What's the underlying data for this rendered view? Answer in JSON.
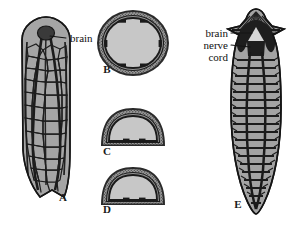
{
  "figure": {
    "background_color": "#ffffff",
    "ink_color": "#1a1a1a",
    "tissue_fill": "#a8a8a8",
    "lumen_fill": "#c9c9c9",
    "dark_fill": "#2b2b2b"
  },
  "panels": [
    {
      "letter": "A",
      "name": "nerve-net-whole-mount",
      "description": "Elongate flatworm body in dorsal view showing irregular meshlike nerve net",
      "letter_x": 63,
      "letter_y": 201
    },
    {
      "letter": "B",
      "name": "oval-cross-section",
      "description": "Rounded oval cross section with stippled cortical layer",
      "letter_x": 107,
      "letter_y": 73
    },
    {
      "letter": "C",
      "name": "dome-cross-section-upper",
      "description": "Dome shaped cross section, flattened ventral surface",
      "letter_x": 107,
      "letter_y": 155
    },
    {
      "letter": "D",
      "name": "dome-cross-section-lower",
      "description": "Dome shaped cross section, flattened ventral surface",
      "letter_x": 107,
      "letter_y": 213
    },
    {
      "letter": "E",
      "name": "ladder-nervous-system-whole-mount",
      "description": "Planarian with auricled head, bilobed brain and ladderlike paired ventral nerve cords",
      "letter_x": 238,
      "letter_y": 208
    }
  ],
  "callouts": [
    {
      "id": "brain-a",
      "label": "brain",
      "text_x": 70,
      "text_y": 42,
      "anchor": "start",
      "leader_from_x": 66,
      "leader_from_y": 38,
      "leader_to_x": 45,
      "leader_to_y": 38,
      "target_panel": "A"
    },
    {
      "id": "brain-e",
      "label": "brain",
      "text_x": 228,
      "text_y": 36,
      "anchor": "end",
      "leader_from_x": 231,
      "leader_from_y": 33,
      "leader_to_x": 252,
      "leader_to_y": 33,
      "target_panel": "E"
    },
    {
      "id": "nerve-cord-e",
      "label": "nerve",
      "label2": "cord",
      "text_x": 228,
      "text_y": 48,
      "text2_x": 228,
      "text2_y": 60,
      "anchor": "end",
      "leader_from_x": 231,
      "leader_from_y": 45,
      "leader_to_x": 248,
      "leader_to_y": 47,
      "target_panel": "E"
    }
  ],
  "labels": {
    "brain_a": "brain",
    "brain_e": "brain",
    "nerve": "nerve",
    "cord": "cord",
    "letter_a": "A",
    "letter_b": "B",
    "letter_c": "C",
    "letter_d": "D",
    "letter_e": "E"
  }
}
